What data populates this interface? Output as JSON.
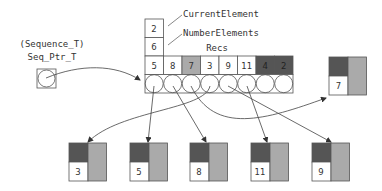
{
  "labels": {
    "type_name": "(Sequence_T)",
    "ptr_name": "Seq_Ptr_T",
    "current_element": "CurrentElement",
    "number_elements": "NumberElements",
    "recs": "Recs"
  },
  "header_cells": {
    "current_element_value": "2",
    "number_elements_value": "6"
  },
  "array_cells": [
    {
      "value": "5",
      "shade": "white"
    },
    {
      "value": "8",
      "shade": "white"
    },
    {
      "value": "7",
      "shade": "light"
    },
    {
      "value": "3",
      "shade": "white"
    },
    {
      "value": "9",
      "shade": "white"
    },
    {
      "value": "11",
      "shade": "white"
    },
    {
      "value": "4",
      "shade": "dark"
    },
    {
      "value": "2",
      "shade": "dark"
    }
  ],
  "bottom_records": [
    {
      "value": "3"
    },
    {
      "value": "5"
    },
    {
      "value": "8"
    },
    {
      "value": "11"
    },
    {
      "value": "9"
    }
  ],
  "right_record": {
    "value": "7"
  },
  "colors": {
    "dark": "#555555",
    "light": "#aaaaaa",
    "line": "#555555"
  }
}
